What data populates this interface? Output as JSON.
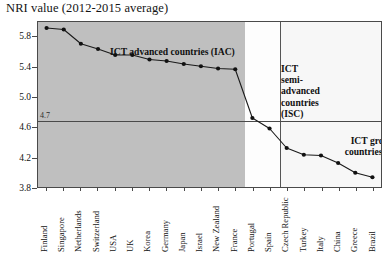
{
  "chart_data": {
    "type": "line",
    "title": "NRI value (2012-2015  average)",
    "xlabel": "",
    "ylabel": "",
    "ylim": [
      3.8,
      6.0
    ],
    "yticks": [
      "5.8",
      "5.4",
      "5.0",
      "4.6",
      "4.2",
      "3.8"
    ],
    "ytick_values": [
      5.8,
      5.4,
      5.0,
      4.6,
      4.2,
      3.8
    ],
    "grid": false,
    "legend": "none",
    "reference_line": {
      "label": "4.7",
      "value": 4.7
    },
    "categories": [
      "Finland",
      "Singapore",
      "Netherlands",
      "Switzerland",
      "USA",
      "UK",
      "Korea",
      "Germany",
      "Japan",
      "Israel",
      "New Zealand",
      "France",
      "Portugal",
      "Spain",
      "Czech Republic",
      "Turkey",
      "Italy",
      "China",
      "Greece",
      "Brazil"
    ],
    "values": [
      5.92,
      5.9,
      5.71,
      5.64,
      5.56,
      5.56,
      5.5,
      5.48,
      5.44,
      5.41,
      5.38,
      5.37,
      4.72,
      4.58,
      4.32,
      4.23,
      4.22,
      4.12,
      3.99,
      3.93
    ],
    "annotations": [
      {
        "key": "iac",
        "text": "ICT advanced countries (IAC)"
      },
      {
        "key": "isc",
        "text": "ICT\nsemi-\nadvanced\ncountries\n(ISC)"
      },
      {
        "key": "igc",
        "text": "ICT growing\ncountries (IGC)"
      }
    ],
    "groups": [
      {
        "name": "ICT advanced countries (IAC)",
        "start": "Finland",
        "end": "France",
        "shade": "#bfbfbf"
      },
      {
        "name": "ICT semi-advanced countries (ISC)",
        "start": "Portugal",
        "end": "Spain",
        "shade": "#fdfdfd"
      },
      {
        "name": "ICT growing countries (IGC)",
        "start": "Czech Republic",
        "end": "Brazil",
        "shade": "#f7f7f7"
      }
    ],
    "colors": {
      "line": "#1a1a1a",
      "marker": "#111111",
      "frame": "#4a4a4a",
      "band_iac": "#bfbfbf",
      "background": "#ffffff"
    }
  }
}
